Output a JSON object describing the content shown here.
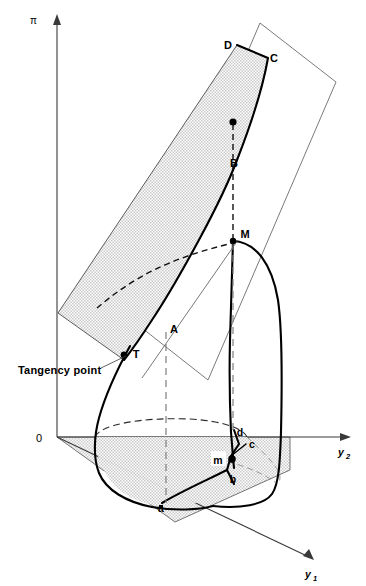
{
  "figure": {
    "axes": {
      "vertical_label": "π",
      "horizontal_label": "y",
      "horizontal_sub": "2",
      "depth_label": "y",
      "depth_sub": "1",
      "origin_label": "0"
    },
    "annotations": {
      "tangency_label": "Tangency point"
    },
    "upper_points": [
      {
        "id": "D",
        "label": "D",
        "x": 237,
        "y": 45
      },
      {
        "id": "C",
        "label": "C",
        "x": 268,
        "y": 58
      },
      {
        "id": "B",
        "label": "B",
        "x": 232,
        "y": 163
      },
      {
        "id": "M",
        "label": "M",
        "x": 240,
        "y": 239
      },
      {
        "id": "A",
        "label": "A",
        "x": 175,
        "y": 329
      },
      {
        "id": "T",
        "label": "T",
        "x": 133,
        "y": 352
      }
    ],
    "lower_points": [
      {
        "id": "d",
        "label": "d",
        "x": 238,
        "y": 432
      },
      {
        "id": "c",
        "label": "c",
        "x": 250,
        "y": 445
      },
      {
        "id": "m",
        "label": "m",
        "x": 219,
        "y": 460
      },
      {
        "id": "b",
        "label": "b",
        "x": 233,
        "y": 479
      },
      {
        "id": "a",
        "label": "a",
        "x": 162,
        "y": 508
      }
    ],
    "colors": {
      "ink": "#000000",
      "axis": "#3a3a3a",
      "shading": "#d9d9d9",
      "outline": "#6b6b6b",
      "dashed": "#7d7d7d"
    }
  }
}
